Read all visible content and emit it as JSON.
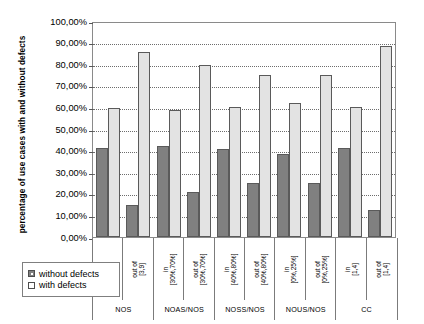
{
  "chart_data": {
    "type": "bar",
    "title": "",
    "xlabel": "",
    "ylabel": "percentage of use cases with and without defects",
    "ylim": [
      0,
      100
    ],
    "grid": true,
    "legend_position": "bottom-left",
    "y_ticks": [
      "0,00%",
      "10,00%",
      "20,00%",
      "30,00%",
      "40,00%",
      "50,00%",
      "60,00%",
      "70,00%",
      "80,00%",
      "90,00%",
      "100,00%"
    ],
    "y_tick_values": [
      0,
      10,
      20,
      30,
      40,
      50,
      60,
      70,
      80,
      90,
      100
    ],
    "categories": [
      "in [3,9]",
      "out of [3,9]",
      "in [30%,70%]",
      "out of [30%,70%]",
      "in [40%,80%]",
      "out of [40%,80%]",
      "in [0%,25%]",
      "out of [0%,25%]",
      "in [1,4]",
      "out of [1,4]"
    ],
    "category_lines": [
      [
        "in",
        "[3,9]"
      ],
      [
        "out of",
        "[3,9]"
      ],
      [
        "in",
        "[30%,70%]"
      ],
      [
        "out of",
        "[30%,70%]"
      ],
      [
        "in",
        "[40%,80%]"
      ],
      [
        "out of",
        "[40%,80%]"
      ],
      [
        "in",
        "[0%,25%]"
      ],
      [
        "out of",
        "[0%,25%]"
      ],
      [
        "in",
        "[1,4]"
      ],
      [
        "out of",
        "[1,4]"
      ]
    ],
    "groups": [
      {
        "label": "NOS",
        "span": 2
      },
      {
        "label": "NOAS/NOS",
        "span": 2
      },
      {
        "label": "NOSS/NOS",
        "span": 2
      },
      {
        "label": "NOUS/NOS",
        "span": 2
      },
      {
        "label": "CC",
        "span": 2
      }
    ],
    "series": [
      {
        "name": "without defects",
        "color": "#808080",
        "values": [
          41.0,
          14.8,
          42.0,
          20.8,
          40.5,
          25.0,
          38.4,
          25.0,
          41.0,
          12.4
        ]
      },
      {
        "name": "with defects",
        "color": "#e3e3e3",
        "values": [
          59.7,
          85.6,
          58.5,
          79.5,
          60.0,
          75.0,
          61.8,
          75.0,
          59.8,
          88.0
        ]
      }
    ]
  },
  "legend": {
    "items": [
      {
        "label": "without defects",
        "swatch": "dark"
      },
      {
        "label": "with defects",
        "swatch": "light"
      }
    ]
  }
}
